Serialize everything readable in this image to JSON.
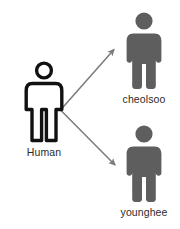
{
  "diagram": {
    "background_color": "#ffffff",
    "width": 180,
    "height": 229,
    "base_color": "#111111",
    "derived_color": "#5e5e5e",
    "arrow_color": "#7a7a7a",
    "label_color": "#2b2b2b",
    "nodes": [
      {
        "id": "human",
        "label": "Human",
        "icon": "person-outline-icon",
        "style": "outline",
        "color": "#111111"
      },
      {
        "id": "cheolsoo",
        "label": "cheolsoo",
        "icon": "person-solid-icon",
        "style": "solid",
        "color": "#5e5e5e"
      },
      {
        "id": "younghee",
        "label": "younghee",
        "icon": "person-solid-icon",
        "style": "solid",
        "color": "#5e5e5e"
      }
    ],
    "edges": [
      {
        "id": "human-to-cheolsoo",
        "from": "human",
        "to": "cheolsoo",
        "arrow": "arrow-up-right-icon"
      },
      {
        "id": "human-to-younghee",
        "from": "human",
        "to": "younghee",
        "arrow": "arrow-down-right-icon"
      }
    ]
  }
}
